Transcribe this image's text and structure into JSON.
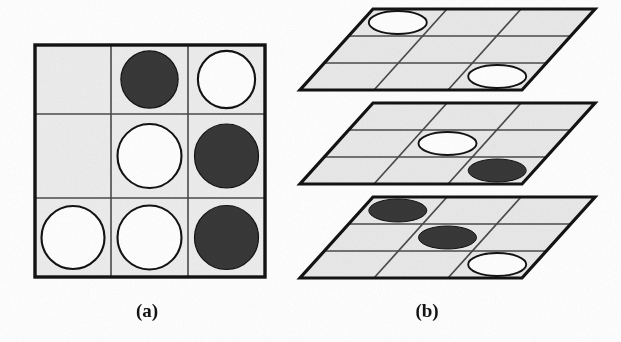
{
  "figure": {
    "background_color": "#ffffff",
    "ink_color": "#131313",
    "cell_fill": "#ededed",
    "plane_fill": "#e9e9e9",
    "white_piece_fill": "#ffffff",
    "dark_piece_fill": "#383838",
    "thin_line_color": "#4a4a4a"
  },
  "panels": [
    {
      "id": "panel-a",
      "label": "(a)",
      "label_x": 147,
      "label_y": 317,
      "type": "flat-grid",
      "rows": 3,
      "cols": 3,
      "x": 35,
      "y": 45,
      "width": 230,
      "height": 232,
      "col_dividers": [
        111,
        188
      ],
      "row_dividers": [
        114,
        198
      ],
      "cells": [
        {
          "row": 1,
          "col": 1,
          "piece": "empty"
        },
        {
          "row": 1,
          "col": 2,
          "piece": "dark"
        },
        {
          "row": 1,
          "col": 3,
          "piece": "white"
        },
        {
          "row": 2,
          "col": 1,
          "piece": "empty"
        },
        {
          "row": 2,
          "col": 2,
          "piece": "white"
        },
        {
          "row": 2,
          "col": 3,
          "piece": "dark"
        },
        {
          "row": 3,
          "col": 1,
          "piece": "white"
        },
        {
          "row": 3,
          "col": 2,
          "piece": "white"
        },
        {
          "row": 3,
          "col": 3,
          "piece": "dark"
        }
      ]
    },
    {
      "id": "panel-b",
      "label": "(b)",
      "label_x": 427,
      "label_y": 317,
      "type": "stacked-planes",
      "plane_count": 3,
      "planes": [
        {
          "index": 1,
          "name": "top-plane",
          "top_left_x": 373,
          "top_y": 9,
          "bottom_left_x": 300,
          "bottom_y": 90,
          "plane_width": 222,
          "cells": [
            {
              "row": 1,
              "col": 1,
              "piece": "white"
            },
            {
              "row": 1,
              "col": 2,
              "piece": "empty"
            },
            {
              "row": 1,
              "col": 3,
              "piece": "empty"
            },
            {
              "row": 2,
              "col": 1,
              "piece": "empty"
            },
            {
              "row": 2,
              "col": 2,
              "piece": "empty"
            },
            {
              "row": 2,
              "col": 3,
              "piece": "empty"
            },
            {
              "row": 3,
              "col": 1,
              "piece": "empty"
            },
            {
              "row": 3,
              "col": 2,
              "piece": "empty"
            },
            {
              "row": 3,
              "col": 3,
              "piece": "white"
            }
          ]
        },
        {
          "index": 2,
          "name": "middle-plane",
          "top_left_x": 373,
          "top_y": 103,
          "bottom_left_x": 300,
          "bottom_y": 184,
          "plane_width": 222,
          "cells": [
            {
              "row": 1,
              "col": 1,
              "piece": "empty"
            },
            {
              "row": 1,
              "col": 2,
              "piece": "empty"
            },
            {
              "row": 1,
              "col": 3,
              "piece": "empty"
            },
            {
              "row": 2,
              "col": 1,
              "piece": "empty"
            },
            {
              "row": 2,
              "col": 2,
              "piece": "white"
            },
            {
              "row": 2,
              "col": 3,
              "piece": "empty"
            },
            {
              "row": 3,
              "col": 1,
              "piece": "empty"
            },
            {
              "row": 3,
              "col": 2,
              "piece": "empty"
            },
            {
              "row": 3,
              "col": 3,
              "piece": "dark"
            }
          ]
        },
        {
          "index": 3,
          "name": "bottom-plane",
          "top_left_x": 373,
          "top_y": 197,
          "bottom_left_x": 300,
          "bottom_y": 278,
          "plane_width": 222,
          "cells": [
            {
              "row": 1,
              "col": 1,
              "piece": "dark"
            },
            {
              "row": 1,
              "col": 2,
              "piece": "empty"
            },
            {
              "row": 1,
              "col": 3,
              "piece": "empty"
            },
            {
              "row": 2,
              "col": 1,
              "piece": "empty"
            },
            {
              "row": 2,
              "col": 2,
              "piece": "dark"
            },
            {
              "row": 2,
              "col": 3,
              "piece": "empty"
            },
            {
              "row": 3,
              "col": 1,
              "piece": "empty"
            },
            {
              "row": 3,
              "col": 2,
              "piece": "empty"
            },
            {
              "row": 3,
              "col": 3,
              "piece": "white"
            }
          ]
        }
      ]
    }
  ]
}
